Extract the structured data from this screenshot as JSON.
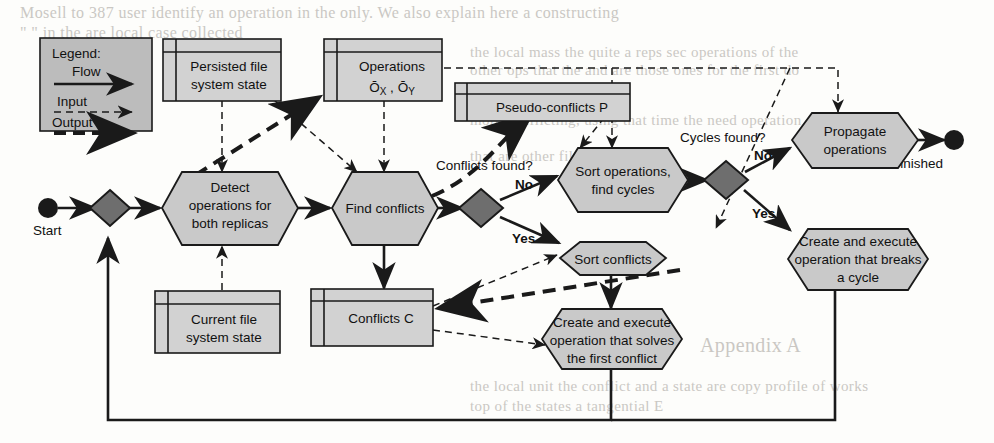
{
  "figure": {
    "type": "flowchart"
  },
  "legend": {
    "heading": "Legend:",
    "entries": [
      {
        "label": "Flow",
        "style": "solid-arrow"
      },
      {
        "label": "Input",
        "style": "thin-dashed-arrow"
      },
      {
        "label": "Output",
        "style": "thick-dashed-arrow"
      }
    ]
  },
  "terminators": {
    "start": "Start",
    "end": "Finished"
  },
  "datastores": [
    {
      "id": "persisted",
      "line1": "Persisted file",
      "line2": "system state"
    },
    {
      "id": "operations",
      "line1": "Operations",
      "line2": "Ō",
      "sub1": "X",
      "sep": " , ",
      "line2b": "Ō",
      "sub2": "Y"
    },
    {
      "id": "pseudo",
      "line1": "Pseudo-conflicts P"
    },
    {
      "id": "current",
      "line1": "Current file",
      "line2": "system state"
    },
    {
      "id": "conflicts",
      "line1": "Conflicts C"
    }
  ],
  "processes": [
    {
      "id": "detect",
      "lines": [
        "Detect",
        "operations for",
        "both replicas"
      ]
    },
    {
      "id": "find",
      "lines": [
        "Find conflicts"
      ]
    },
    {
      "id": "sortops",
      "lines": [
        "Sort operations,",
        "find cycles"
      ]
    },
    {
      "id": "sortconf",
      "lines": [
        "Sort conflicts"
      ]
    },
    {
      "id": "propagate",
      "lines": [
        "Propagate",
        "operations"
      ]
    },
    {
      "id": "breakcycle",
      "lines": [
        "Create and execute",
        "operation that breaks",
        "a cycle"
      ]
    },
    {
      "id": "solveconf",
      "lines": [
        "Create and execute",
        "operation that solves",
        "the first conflict"
      ]
    }
  ],
  "decisions": [
    {
      "id": "d-start",
      "question": "",
      "branches": []
    },
    {
      "id": "d-conflicts",
      "question": "Conflicts found?",
      "branches": [
        {
          "label": "No"
        },
        {
          "label": "Yes"
        }
      ]
    },
    {
      "id": "d-cycles",
      "question": "Cycles found?",
      "branches": [
        {
          "label": "No"
        },
        {
          "label": "Yes"
        }
      ]
    }
  ],
  "edge_labels": {
    "conflicts_no": "No",
    "conflicts_yes": "Yes",
    "cycles_no": "No",
    "cycles_yes": "Yes"
  },
  "colors": {
    "node_fill": "#c9c9c9",
    "datastore_fill": "#d2d2d2",
    "decision_fill": "#6e6e6e",
    "stroke": "#1a1a1a",
    "legend_fill": "#bcbcbc",
    "background": "#fdfdfb"
  },
  "background_text": {
    "lines": [
      {
        "text": "Mosell to 387 user identify an operation in the only. We also explain here a constructing",
        "x": 20,
        "y": 4,
        "size": 16
      },
      {
        "text": "\" \" in the are local case collected",
        "x": 20,
        "y": 24,
        "size": 16
      },
      {
        "text": "the local mass the quite a reps sec operations of the",
        "x": 470,
        "y": 44,
        "size": 15
      },
      {
        "text": "other ops that the and are those ones for the first do",
        "x": 470,
        "y": 62,
        "size": 15
      },
      {
        "text": "more conflicting, using that time the need operation on the",
        "x": 470,
        "y": 112,
        "size": 15
      },
      {
        "text": "that are other files",
        "x": 470,
        "y": 148,
        "size": 15
      },
      {
        "text": "Appendix A",
        "x": 700,
        "y": 334,
        "size": 20
      },
      {
        "text": "the local unit the conflict and a state are copy profile of works",
        "x": 470,
        "y": 378,
        "size": 15
      },
      {
        "text": "top of the states a tangential E",
        "x": 470,
        "y": 398,
        "size": 15
      }
    ]
  }
}
